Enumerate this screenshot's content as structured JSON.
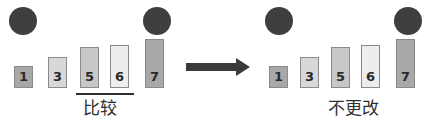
{
  "diagram": {
    "colors": {
      "node": "#3f3f3f",
      "arrow": "#3a3a3a",
      "bar_border": "#8a8a8a",
      "text": "#2f2f2f",
      "bar_dark": "#a8a8a8",
      "bar_light": "#d8d8d8",
      "bar_medium": "#c8c8c8",
      "bar_pale": "#ededed"
    },
    "arrow": {
      "name": "transition-arrow",
      "direction": "right"
    },
    "panels": [
      {
        "id": "before",
        "caption": "比较",
        "caption_underlined": true,
        "circles": [
          {
            "name": "node-marker-left",
            "x": 9,
            "y": 7,
            "size": 28
          },
          {
            "name": "node-marker-selected",
            "x": 143,
            "y": 7,
            "size": 28
          }
        ],
        "bars": [
          {
            "label": "1",
            "x": 14,
            "y": 66,
            "width": 19,
            "height": 22,
            "fill": "#a8a8a8"
          },
          {
            "label": "3",
            "x": 48,
            "y": 57,
            "width": 19,
            "height": 31,
            "fill": "#d8d8d8"
          },
          {
            "label": "5",
            "x": 80,
            "y": 47,
            "width": 19,
            "height": 41,
            "fill": "#c8c8c8"
          },
          {
            "label": "6",
            "x": 110,
            "y": 45,
            "width": 19,
            "height": 43,
            "fill": "#ededed"
          },
          {
            "label": "7",
            "x": 145,
            "y": 39,
            "width": 19,
            "height": 49,
            "fill": "#a8a8a8"
          }
        ],
        "underline": {
          "x": 76,
          "y": 93,
          "width": 58,
          "height": 2
        },
        "caption_pos": {
          "x": 83,
          "y": 100
        }
      },
      {
        "id": "after",
        "caption": "不更改",
        "caption_underlined": false,
        "circles": [
          {
            "name": "node-marker-left",
            "x": 265,
            "y": 7,
            "size": 28
          },
          {
            "name": "node-marker-selected",
            "x": 394,
            "y": 7,
            "size": 28
          }
        ],
        "bars": [
          {
            "label": "1",
            "x": 269,
            "y": 66,
            "width": 19,
            "height": 22,
            "fill": "#a8a8a8"
          },
          {
            "label": "3",
            "x": 300,
            "y": 57,
            "width": 19,
            "height": 31,
            "fill": "#d8d8d8"
          },
          {
            "label": "5",
            "x": 331,
            "y": 47,
            "width": 19,
            "height": 41,
            "fill": "#c8c8c8"
          },
          {
            "label": "6",
            "x": 361,
            "y": 45,
            "width": 19,
            "height": 43,
            "fill": "#ededed"
          },
          {
            "label": "7",
            "x": 396,
            "y": 39,
            "width": 19,
            "height": 49,
            "fill": "#a8a8a8"
          }
        ],
        "underline": null,
        "caption_pos": {
          "x": 328,
          "y": 100
        }
      }
    ],
    "arrow_geometry": {
      "shaft_x": 186,
      "shaft_y": 63,
      "shaft_width": 52,
      "shaft_height": 8,
      "head_x": 236,
      "head_y": 58
    }
  }
}
